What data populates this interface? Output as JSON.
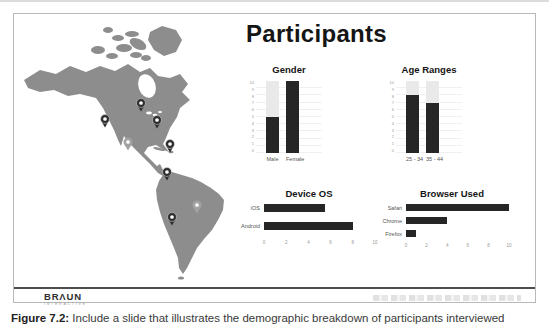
{
  "page": {
    "caption_label": "Figure 7.2:",
    "caption_text": " Include a slide that illustrates the demographic breakdown of participants interviewed"
  },
  "slide": {
    "title": "Participants",
    "logo": {
      "left": "BR",
      "mark": "Λ",
      "right": "UN",
      "tagline": "INTERACTIVE"
    },
    "colors": {
      "bar_dark": "#262626",
      "bar_light": "#e9e9e9",
      "map_gray": "#8d8d8d",
      "pin_dark": "#2e2e2e",
      "pin_light": "#a2a2a2"
    }
  },
  "map": {
    "region": "Americas",
    "pins": [
      {
        "x": 121,
        "y": 89,
        "variant": "dark",
        "area": "central-canada"
      },
      {
        "x": 137,
        "y": 106,
        "variant": "dark",
        "area": "us-east"
      },
      {
        "x": 85,
        "y": 105,
        "variant": "dark",
        "area": "us-west-coast"
      },
      {
        "x": 150,
        "y": 130,
        "variant": "dark",
        "area": "caribbean"
      },
      {
        "x": 147,
        "y": 158,
        "variant": "dark",
        "area": "colombia"
      },
      {
        "x": 152,
        "y": 203,
        "variant": "dark",
        "area": "chile-argentina"
      },
      {
        "x": 108,
        "y": 128,
        "variant": "light",
        "area": "mexico"
      },
      {
        "x": 177,
        "y": 191,
        "variant": "light",
        "area": "brazil"
      }
    ]
  },
  "chart_data": [
    {
      "id": "gender",
      "type": "bar",
      "title": "Gender",
      "categories": [
        "Male",
        "Female"
      ],
      "values": [
        5,
        10
      ],
      "ylim": [
        0,
        10
      ],
      "yticks": [
        0,
        1,
        2,
        3,
        4,
        5,
        6,
        7,
        8,
        9,
        10
      ],
      "track_max": 10,
      "grid": true,
      "legend": "none"
    },
    {
      "id": "age_ranges",
      "type": "bar",
      "title": "Age Ranges",
      "categories": [
        "25 - 34",
        "35 - 44"
      ],
      "values": [
        8,
        7
      ],
      "ylim": [
        0,
        10
      ],
      "yticks": [
        0,
        1,
        2,
        3,
        4,
        5,
        6,
        7,
        8,
        9,
        10
      ],
      "track_max": 10,
      "grid": true,
      "legend": "none"
    },
    {
      "id": "device_os",
      "type": "hbar",
      "title": "Device OS",
      "categories": [
        "iOS",
        "Android"
      ],
      "values": [
        5.5,
        8
      ],
      "xlim": [
        0,
        10
      ],
      "xticks": [
        0,
        2,
        4,
        6,
        8,
        10
      ],
      "legend": "none"
    },
    {
      "id": "browser",
      "type": "hbar",
      "title": "Browser Used",
      "categories": [
        "Safari",
        "Chrome",
        "Firefox"
      ],
      "values": [
        10,
        4,
        1
      ],
      "xlim": [
        0,
        10
      ],
      "xticks": [
        0,
        2,
        4,
        6,
        8,
        10
      ],
      "legend": "none"
    }
  ]
}
